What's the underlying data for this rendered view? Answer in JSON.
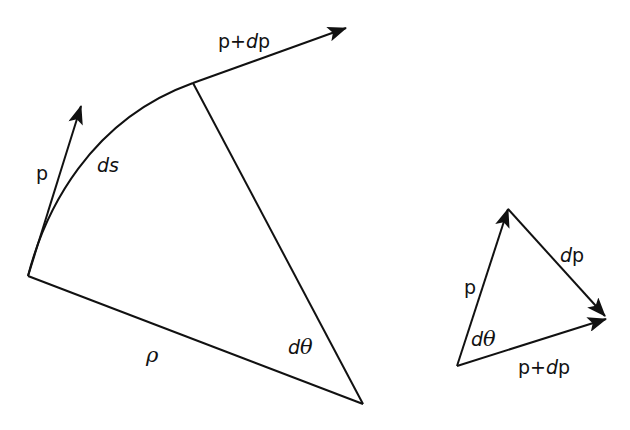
{
  "diagram": {
    "type": "curvature-vector-geometry",
    "colors": {
      "stroke": "#111111",
      "background": "#ffffff"
    },
    "main_figure": {
      "labels": {
        "p_plus_dp_prefix": "p+",
        "p_plus_dp_d": "d",
        "p_plus_dp_suffix": "p",
        "p": "p",
        "ds": "ds",
        "rho": "ρ",
        "dtheta_d": "d",
        "dtheta_theta": "θ"
      }
    },
    "vector_triangle": {
      "labels": {
        "p": "p",
        "dp_d": "d",
        "dp_p": "p",
        "dtheta_d": "d",
        "dtheta_theta": "θ",
        "p_plus_dp_prefix": "p+",
        "p_plus_dp_d": "d",
        "p_plus_dp_suffix": "p"
      }
    }
  }
}
